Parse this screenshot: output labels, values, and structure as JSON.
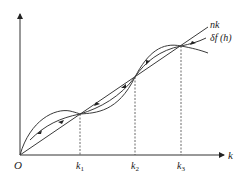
{
  "diagram": {
    "origin_label": "O",
    "x_axis_label": "k",
    "line_label": "nk",
    "curve_label": "δf (h)",
    "ticks": [
      {
        "label": "k",
        "sub": "1"
      },
      {
        "label": "k",
        "sub": "2"
      },
      {
        "label": "k",
        "sub": "3"
      }
    ],
    "stroke_color": "#3a3a3a"
  }
}
